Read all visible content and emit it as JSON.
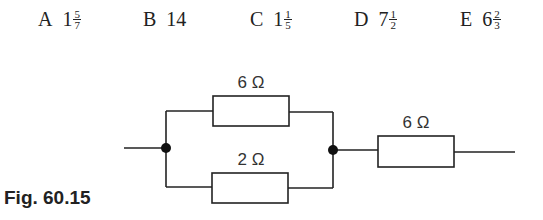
{
  "options": [
    {
      "letter": "A",
      "whole": "1",
      "num": "5",
      "den": "7"
    },
    {
      "letter": "B",
      "whole": "14",
      "num": "",
      "den": ""
    },
    {
      "letter": "C",
      "whole": "1",
      "num": "1",
      "den": "5"
    },
    {
      "letter": "D",
      "whole": "7",
      "num": "1",
      "den": "2"
    },
    {
      "letter": "E",
      "whole": "6",
      "num": "2",
      "den": "3"
    }
  ],
  "circuit": {
    "top_resistor": "6 Ω",
    "bottom_resistor": "2 Ω",
    "series_resistor": "6 Ω"
  },
  "caption": "Fig. 60.15"
}
